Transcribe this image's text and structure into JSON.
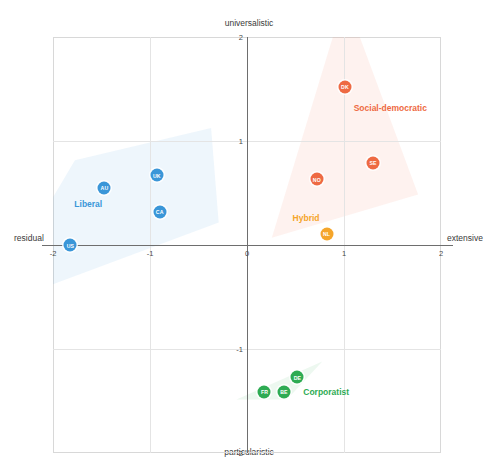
{
  "chart_data": {
    "type": "scatter",
    "title": "",
    "xlabel_left": "residual",
    "xlabel_right": "extensive",
    "ylabel_top": "universalistic",
    "ylabel_bottom": "particularistic",
    "xlim": [
      -2,
      2
    ],
    "ylim": [
      -2,
      2
    ],
    "xticks": [
      -2,
      -1,
      0,
      1,
      2
    ],
    "yticks": [
      -2,
      -1,
      0,
      1,
      2
    ],
    "xtick_labels": [
      "-2",
      "-1",
      "0",
      "1",
      "2"
    ],
    "ytick_labels": [
      "-2",
      "-1",
      "0",
      "1",
      "2"
    ],
    "grid": true,
    "legend": "in-plot group labels",
    "groups": [
      {
        "name": "Liberal",
        "color": "#3a96d8",
        "label_x": -1.78,
        "label_y": 0.39,
        "points": [
          {
            "code": "US",
            "x": -1.82,
            "y": 0.0
          },
          {
            "code": "AU",
            "x": -1.47,
            "y": 0.55
          },
          {
            "code": "UK",
            "x": -0.93,
            "y": 0.67
          },
          {
            "code": "CA",
            "x": -0.9,
            "y": 0.32
          }
        ]
      },
      {
        "name": "Social-democratic",
        "color": "#ee6a43",
        "label_x": 1.1,
        "label_y": 1.32,
        "points": [
          {
            "code": "NO",
            "x": 0.72,
            "y": 0.63
          },
          {
            "code": "DK",
            "x": 1.01,
            "y": 1.52
          },
          {
            "code": "SE",
            "x": 1.3,
            "y": 0.79
          }
        ]
      },
      {
        "name": "Hybrid",
        "color": "#f5a52a",
        "label_x": 0.47,
        "label_y": 0.26,
        "points": [
          {
            "code": "NL",
            "x": 0.82,
            "y": 0.11
          }
        ]
      },
      {
        "name": "Corporatist",
        "color": "#2eab53",
        "label_x": 0.58,
        "label_y": -1.41,
        "points": [
          {
            "code": "FR",
            "x": 0.18,
            "y": -1.41
          },
          {
            "code": "BE",
            "x": 0.38,
            "y": -1.41
          },
          {
            "code": "DE",
            "x": 0.52,
            "y": -1.27
          }
        ]
      }
    ]
  }
}
